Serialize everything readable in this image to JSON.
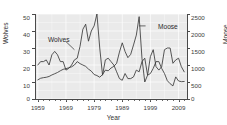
{
  "chart_data": {
    "type": "line",
    "title": "",
    "subtitle": "",
    "xlabel": "Year",
    "ylabel": "Wolves",
    "y2label": "Moose",
    "xlim": [
      1958,
      2012
    ],
    "ylim": [
      0,
      50
    ],
    "y2lim": [
      0,
      2500
    ],
    "grid": true,
    "grid_color": "#ffffff",
    "panel_color": "#eaeaea",
    "line_color": "#3a3a3a",
    "legend": "none",
    "xticks": [
      1959,
      1969,
      1979,
      1989,
      1999,
      2009
    ],
    "xticks_minor_step": 2,
    "yticks": [
      0,
      10,
      20,
      30,
      40,
      50
    ],
    "y2ticks": [
      0,
      500,
      1000,
      1500,
      2000,
      2500
    ],
    "annotations": [
      {
        "text": "Wolves",
        "x": 1966,
        "y": 34,
        "points_to_x": 1972,
        "points_to_y": 29
      },
      {
        "text": "Moose",
        "x": 1998,
        "y": 43,
        "points_to_x": 1995,
        "points_to_y": 47
      }
    ],
    "x": [
      1959,
      1960,
      1961,
      1962,
      1963,
      1964,
      1965,
      1966,
      1967,
      1968,
      1969,
      1970,
      1971,
      1972,
      1973,
      1974,
      1975,
      1976,
      1977,
      1978,
      1979,
      1980,
      1981,
      1982,
      1983,
      1984,
      1985,
      1986,
      1987,
      1988,
      1989,
      1990,
      1991,
      1992,
      1993,
      1994,
      1995,
      1996,
      1997,
      1998,
      1999,
      2000,
      2001,
      2002,
      2003,
      2004,
      2005,
      2006,
      2007,
      2008,
      2009,
      2010,
      2011
    ],
    "series": [
      {
        "name": "Wolves",
        "axis": "left",
        "unit": "count",
        "values": [
          20,
          22,
          22,
          23,
          20,
          26,
          28,
          26,
          22,
          22,
          17,
          18,
          20,
          23,
          24,
          31,
          41,
          44,
          34,
          40,
          43,
          50,
          30,
          14,
          23,
          24,
          22,
          20,
          16,
          12,
          11,
          15,
          12,
          12,
          13,
          17,
          16,
          22,
          24,
          14,
          25,
          29,
          19,
          17,
          19,
          29,
          30,
          30,
          21,
          23,
          24,
          19,
          16
        ]
      },
      {
        "name": "Moose",
        "axis": "right",
        "unit": "count",
        "values": [
          563,
          610,
          628,
          639,
          663,
          707,
          743,
          780,
          830,
          872,
          892,
          920,
          946,
          1000,
          1100,
          1040,
          1000,
          960,
          880,
          820,
          720,
          690,
          640,
          720,
          850,
          830,
          910,
          960,
          1050,
          1380,
          1653,
          1397,
          1216,
          1313,
          1590,
          1879,
          2422,
          1200,
          500,
          700,
          750,
          900,
          1100,
          1100,
          900,
          750,
          540,
          450,
          385,
          650,
          530,
          510,
          515
        ]
      }
    ]
  },
  "axes": {
    "x_tick_labels": [
      "1959",
      "1969",
      "1979",
      "1989",
      "1999",
      "2009"
    ],
    "y_left_tick_labels": [
      "0",
      "10",
      "20",
      "30",
      "40",
      "50"
    ],
    "y_right_tick_labels": [
      "0",
      "500",
      "1000",
      "1500",
      "2000",
      "2500"
    ],
    "x_title": "Year",
    "y_left_title": "Wolves",
    "y_right_title": "Moose"
  },
  "annotations": {
    "wolves_label": "Wolves",
    "moose_label": "Moose"
  }
}
